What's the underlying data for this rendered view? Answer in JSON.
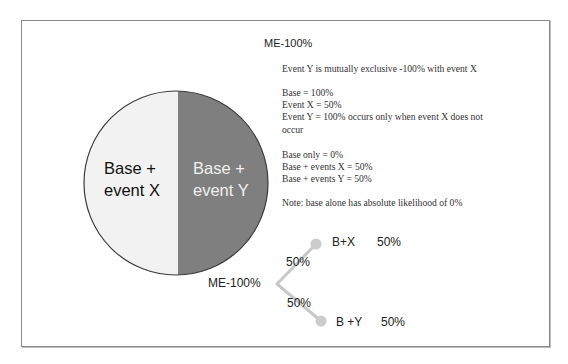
{
  "diagram": {
    "title": "ME-100%",
    "description": {
      "line1": "Event Y is mutually exclusive -100% with event X",
      "base": "Base = 100%",
      "event_x": "Event X  = 50%",
      "event_y_a": "Event Y = 100% occurs only when event X does not",
      "event_y_b": "occur",
      "base_only": "Base only = 0%",
      "base_events_x": "Base + events X = 50%",
      "base_events_y": "Base + events Y  = 50%",
      "note": "Note: base alone has absolute likelihood of 0%"
    },
    "circle": {
      "left_label_1": "Base +",
      "left_label_2": "event X",
      "right_label_1": "Base +",
      "right_label_2": "event Y",
      "left_color": "#f2f2f2",
      "right_color": "#7f7f7f"
    },
    "tree": {
      "root_label": "ME-100%",
      "upper_edge_label": "50%",
      "lower_edge_label": "50%",
      "upper_node_label": "B+X",
      "upper_node_value": "50%",
      "lower_node_label": "B +Y",
      "lower_node_value": "50%",
      "line_color": "#c8c8c8"
    }
  }
}
